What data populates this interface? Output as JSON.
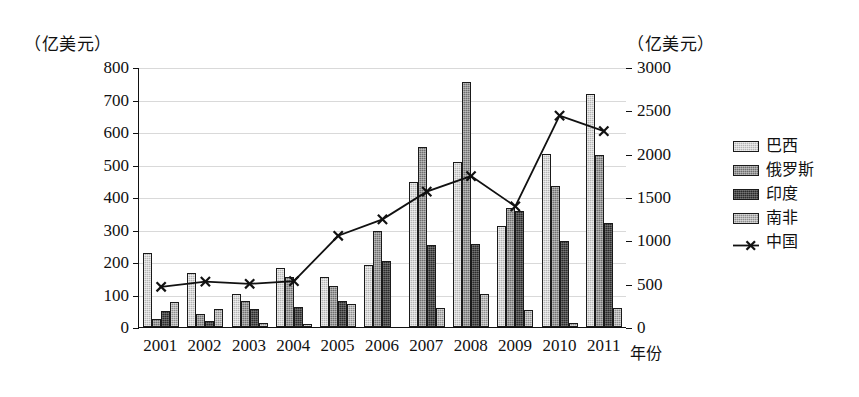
{
  "chart_data": {
    "type": "bar",
    "title": "",
    "subtitle": "",
    "xlabel": "年份",
    "ylabel": "（亿美元）",
    "ylabel_right": "（亿美元）",
    "grid": true,
    "legend_position": "right",
    "categories": [
      "2001",
      "2002",
      "2003",
      "2004",
      "2005",
      "2006",
      "2007",
      "2008",
      "2009",
      "2010",
      "2011"
    ],
    "left_axis": {
      "unit": "（亿美元）",
      "ticks": [
        0,
        100,
        200,
        300,
        400,
        500,
        600,
        700,
        800
      ],
      "ylim": [
        0,
        800
      ]
    },
    "right_axis": {
      "unit": "（亿美元）",
      "ticks": [
        0,
        500,
        1000,
        1500,
        2000,
        2500,
        3000
      ],
      "ylim": [
        0,
        3000
      ]
    },
    "series": [
      {
        "name": "巴西",
        "type": "bar",
        "axis": "left",
        "color": "#b5b5b5",
        "values": [
          228,
          166,
          103,
          183,
          153,
          192,
          447,
          508,
          311,
          533,
          718
        ]
      },
      {
        "name": "俄罗斯",
        "type": "bar",
        "axis": "left",
        "color": "#6f6f6f",
        "values": [
          25,
          41,
          79,
          153,
          125,
          296,
          553,
          753,
          365,
          434,
          529
        ]
      },
      {
        "name": "印度",
        "type": "bar",
        "axis": "left",
        "color": "#2b2b2b",
        "values": [
          50,
          20,
          55,
          63,
          81,
          203,
          251,
          256,
          356,
          264,
          319
        ]
      },
      {
        "name": "南非",
        "type": "bar",
        "axis": "left",
        "color": "#8e8e8e",
        "values": [
          78,
          56,
          13,
          8,
          70,
          0,
          59,
          101,
          53,
          12,
          60
        ]
      },
      {
        "name": "中国",
        "type": "line",
        "axis": "right",
        "color": "#111111",
        "marker": "x",
        "values": [
          470,
          530,
          505,
          535,
          1060,
          1250,
          1570,
          1750,
          1400,
          2450,
          2270
        ]
      }
    ]
  },
  "legend": {
    "items": [
      {
        "label": "巴西",
        "kind": "swatch"
      },
      {
        "label": "俄罗斯",
        "kind": "swatch"
      },
      {
        "label": "印度",
        "kind": "swatch"
      },
      {
        "label": "南非",
        "kind": "swatch"
      },
      {
        "label": "中国",
        "kind": "line-marker"
      }
    ]
  }
}
